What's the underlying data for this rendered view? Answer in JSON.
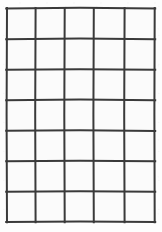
{
  "figure": {
    "kind": "blank-grid-table",
    "columns": 5,
    "rows": 7,
    "total_cells": 35,
    "cells_filled": 0,
    "cell_contents": [
      [
        "",
        "",
        "",
        "",
        ""
      ],
      [
        "",
        "",
        "",
        "",
        ""
      ],
      [
        "",
        "",
        "",
        "",
        ""
      ],
      [
        "",
        "",
        "",
        "",
        ""
      ],
      [
        "",
        "",
        "",
        "",
        ""
      ],
      [
        "",
        "",
        "",
        "",
        ""
      ],
      [
        "",
        "",
        "",
        "",
        ""
      ]
    ]
  },
  "geometry": {
    "canvas_width": 162,
    "canvas_height": 232,
    "vertical_line_x": [
      6.5,
      35.5,
      64.5,
      93.5,
      124.5,
      155.0
    ],
    "horizontal_line_y": [
      8.0,
      39.0,
      69.5,
      100.0,
      130.5,
      161.0,
      191.5,
      222.0
    ],
    "line_width": 2.0,
    "outer_line_width": 2.2
  },
  "colors": {
    "page_background": "#ffffff",
    "paper": "#fdfdfd",
    "cell_fill": "#fbfbfb",
    "grid_line": "#3a3a3a",
    "grid_line_soft": "#4a4a4a"
  },
  "labels": {
    "title": "",
    "caption": "",
    "axis_x": "",
    "axis_y": ""
  }
}
